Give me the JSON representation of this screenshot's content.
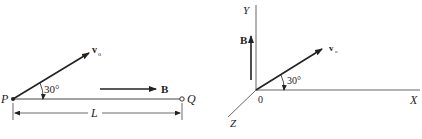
{
  "figure_left": {
    "point_p": "P",
    "point_q": "Q",
    "velocity_label": "v",
    "velocity_subscript": "o",
    "angle_label": "30°",
    "field_label": "B",
    "length_label": "L"
  },
  "figure_right": {
    "axis_x": "X",
    "axis_y": "Y",
    "axis_z": "Z",
    "origin_label": "0",
    "velocity_label": "v",
    "velocity_subscript": "o",
    "angle_label": "30°",
    "field_label": "B"
  },
  "colors": {
    "stroke": "#333333",
    "text": "#222222"
  }
}
